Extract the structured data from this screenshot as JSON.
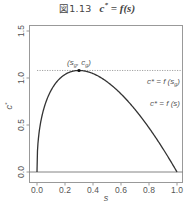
{
  "title": {
    "figure_number": "図1.13",
    "equation_lhs": "c",
    "equation_sup": "*",
    "equation_rhs": " = f(s)"
  },
  "chart_data": {
    "type": "line",
    "xlabel": "s",
    "ylabel": "c*",
    "xlim": [
      0.0,
      1.0
    ],
    "ylim": [
      0.0,
      1.5
    ],
    "x_ticks": [
      "0.0",
      "0.2",
      "0.4",
      "0.6",
      "0.8",
      "1.0"
    ],
    "y_ticks": [
      "0.0",
      "0.5",
      "1.0",
      "1.5"
    ],
    "grid": false,
    "series": [
      {
        "name": "c* = f(s)",
        "style": "solid",
        "x": [
          0.0,
          0.01,
          0.025,
          0.05,
          0.1,
          0.15,
          0.2,
          0.25,
          0.3,
          0.35,
          0.4,
          0.5,
          0.6,
          0.7,
          0.8,
          0.9,
          1.0
        ],
        "y": [
          0.0,
          0.35,
          0.52,
          0.68,
          0.87,
          0.97,
          1.03,
          1.07,
          1.08,
          1.07,
          1.05,
          0.96,
          0.83,
          0.67,
          0.47,
          0.24,
          0.0
        ]
      },
      {
        "name": "c* = f(s_g)",
        "style": "dotted",
        "x": [
          0.0,
          1.0
        ],
        "y": [
          1.08,
          1.08
        ]
      }
    ],
    "reference_lines": [
      {
        "type": "horizontal",
        "y": 0.0,
        "style": "solid"
      }
    ],
    "annotations": [
      {
        "text": "(s_g, c_g)",
        "x": 0.3,
        "y": 1.08,
        "marker": "point"
      },
      {
        "text": "c* = f(s_g)",
        "position": "right, below dotted line"
      },
      {
        "text": "c* = f(s)",
        "position": "right, near curve"
      }
    ]
  },
  "labels": {
    "xlabel": "s",
    "ylabel_base": "c",
    "ylabel_sup": "*",
    "peak": "(s",
    "peak_sub1": "g",
    "peak_mid": ", c",
    "peak_sub2": "g",
    "peak_end": ")",
    "line_label_g": "c* = f (s",
    "line_label_g_sub": "g",
    "line_label_g_end": ")",
    "curve_label": "c* = f (s)"
  }
}
